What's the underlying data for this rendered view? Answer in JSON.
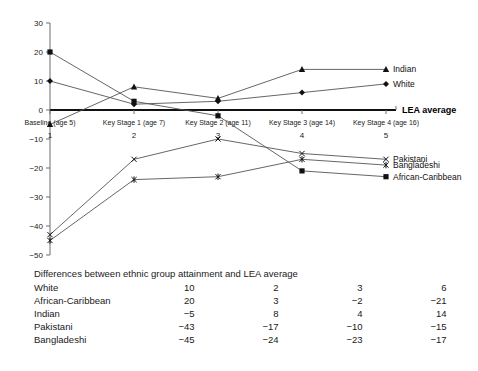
{
  "chart_data": {
    "type": "line",
    "title": "",
    "xlabel": "",
    "ylabel": "",
    "ylim": [
      -50,
      30
    ],
    "ytick_step": 10,
    "grid": false,
    "legend_position": "right-inline",
    "x": [
      1,
      2,
      3,
      4,
      5
    ],
    "x_tick_numbers": [
      "1",
      "2",
      "3",
      "4",
      "5"
    ],
    "x_stage_labels": [
      "Baseline (age 5)",
      "Key Stage 1 (age 7)",
      "Key Stage 2 (age 11)",
      "Key Stage 3 (age 14)",
      "Key Stage 4 (age 16)"
    ],
    "ytick_labels": [
      "30",
      "20",
      "10",
      "0",
      "−10",
      "−20",
      "−30",
      "−40",
      "−50"
    ],
    "ytick_values": [
      30,
      20,
      10,
      0,
      -10,
      -20,
      -30,
      -40,
      -50
    ],
    "baseline_label": "LEA average",
    "baseline_value": 0,
    "series": [
      {
        "name": "Indian",
        "marker": "triangle",
        "values": [
          -5,
          8,
          4,
          14,
          14
        ]
      },
      {
        "name": "White",
        "marker": "diamond",
        "values": [
          10,
          2,
          3,
          6,
          9
        ]
      },
      {
        "name": "African-Caribbean",
        "marker": "square",
        "values": [
          20,
          3,
          -2,
          -21,
          -23
        ]
      },
      {
        "name": "Pakistani",
        "marker": "cross",
        "values": [
          -43,
          -17,
          -10,
          -15,
          -17
        ]
      },
      {
        "name": "Bangladeshi",
        "marker": "asterisk",
        "values": [
          -45,
          -24,
          -23,
          -17,
          -19
        ]
      }
    ]
  },
  "table": {
    "title": "Differences between ethnic group attainment and LEA average",
    "rows": [
      {
        "label": "White",
        "values": [
          "10",
          "2",
          "3",
          "6"
        ]
      },
      {
        "label": "African-Caribbean",
        "values": [
          "20",
          "3",
          "−2",
          "−21"
        ]
      },
      {
        "label": "Indian",
        "values": [
          "−5",
          "8",
          "4",
          "14"
        ]
      },
      {
        "label": "Pakistani",
        "values": [
          "−43",
          "−17",
          "−10",
          "−15"
        ]
      },
      {
        "label": "Bangladeshi",
        "values": [
          "−45",
          "−24",
          "−23",
          "−17"
        ]
      }
    ]
  },
  "colors": {
    "line": "#555555",
    "axis": "#6e6e6e",
    "baseline": "#111111",
    "text": "#1a1a1a",
    "background": "#ffffff"
  }
}
